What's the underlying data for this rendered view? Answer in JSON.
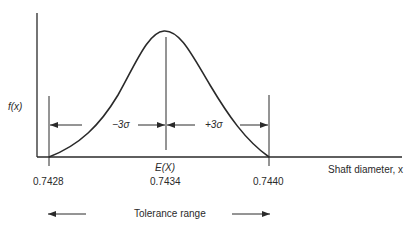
{
  "diagram": {
    "y_label": "f(x)",
    "x_label": "Shaft diameter, x",
    "ticks": [
      {
        "value": "0.7428"
      },
      {
        "value": "0.7434"
      },
      {
        "value": "0.7440"
      }
    ],
    "mean_label": "E(X)",
    "minus_label": "−3σ",
    "plus_label": "+3σ",
    "tolerance_label": "Tolerance range"
  }
}
